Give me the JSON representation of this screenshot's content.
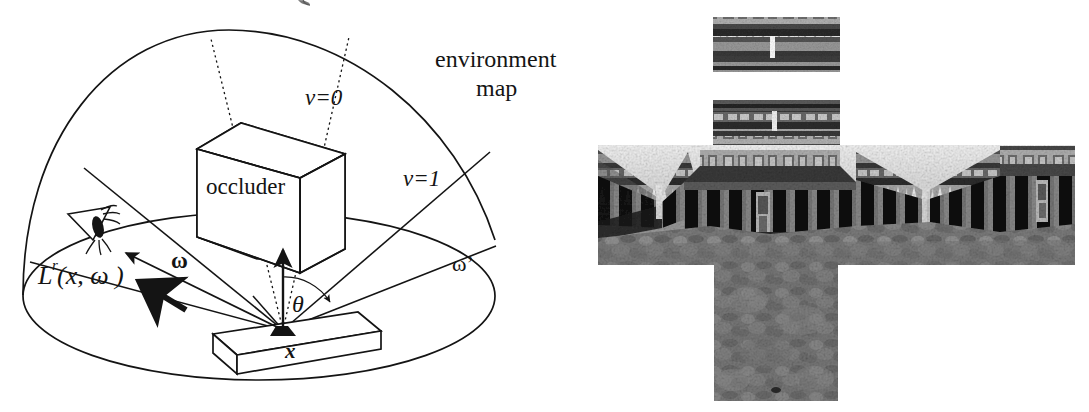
{
  "figure": {
    "domain": "Diagram",
    "background_color": "#ffffff",
    "ink_color": "#141414"
  },
  "diagram": {
    "name": "environment-map-hemisphere-diagram",
    "labels": {
      "environment_map_line1": "environment",
      "environment_map_line2": "map",
      "occluder": "occluder",
      "v_zero": "v=0",
      "v_one": "v=1",
      "omega": "ω",
      "omega_prime": "ω’",
      "theta": "θ",
      "radiance": "L",
      "radiance_superscript": "r",
      "radiance_args": "(x, ω )",
      "point_x": "x"
    },
    "elements": {
      "hemisphere": "hemispherical dome outline",
      "ground_ellipse": "ground plane ellipse",
      "occluder_box": "3D rectangular box labelled occluder",
      "surface_slab": "flat receiving surface slab",
      "normal_arrow": "surface normal arrow at x",
      "view_arrow": "outgoing radiance arrow toward eye",
      "incident_arrow": "bold incident light arrow",
      "eye": "eye viewing the surface",
      "shadow_cone": "dotted lines bounding occluded directions",
      "zone_lines": "solid lines subdividing the hemisphere into visibility zones",
      "theta_arc": "angle arc between normal and omega-prime"
    },
    "colors": {
      "stroke": "#141414",
      "fill": "#ffffff"
    }
  },
  "envmap": {
    "name": "cube-map-cross-photograph",
    "description": "Unfolded cube environment map of a classical colonnaded courtyard, laid out as a cross",
    "layout": "vertical-cross",
    "faces": [
      {
        "name": "top-face",
        "x": 713,
        "y": 17,
        "w": 127,
        "h": 55
      },
      {
        "name": "upper-face",
        "x": 713,
        "y": 100,
        "w": 127,
        "h": 48
      },
      {
        "name": "middle-band",
        "x": 598,
        "y": 145,
        "w": 477,
        "h": 120
      },
      {
        "name": "bottom-face",
        "x": 714,
        "y": 262,
        "w": 124,
        "h": 139
      }
    ],
    "palette": {
      "dark": "#1d1d1d",
      "mid": "#6d6d6d",
      "light": "#d6d6d6",
      "highlight": "#f2f2f2"
    }
  }
}
